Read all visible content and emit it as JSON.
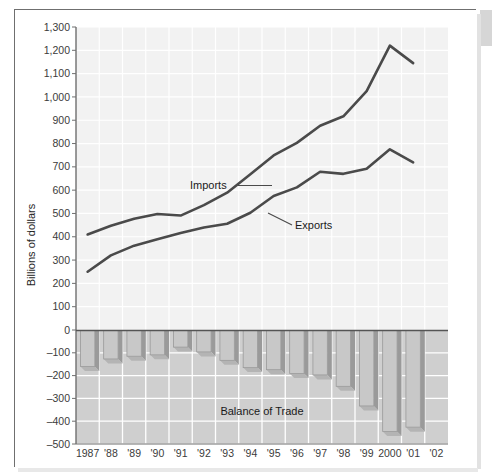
{
  "figure": {
    "y_axis_title": "Billions of dollars",
    "bars_annotation": "Balance of Trade",
    "imports_label": "Imports",
    "exports_label": "Exports",
    "colors": {
      "line": "#4a4a4a",
      "bar_face": "#c8c8c8",
      "bar_edge": "#9a9a9a",
      "upper_panel_bg": "#f2f2f2",
      "lower_panel_bg": "#cfcfcf",
      "grid": "#ffffff",
      "axis": "#6f6f6f",
      "text": "#1f1f1f"
    }
  },
  "chart_data": {
    "type": "line",
    "title": "",
    "xlabel": "",
    "ylabel": "Billions of dollars",
    "grid": true,
    "legend_position": "inline-annotations",
    "x": [
      1987,
      1988,
      1989,
      1990,
      1991,
      1992,
      1993,
      1994,
      1995,
      1996,
      1997,
      1998,
      1999,
      2000,
      2001
    ],
    "tick_labels_x": [
      "1987",
      "'88",
      "'89",
      "'90",
      "'91",
      "'92",
      "'93",
      "'94",
      "'95",
      "'96",
      "'97",
      "'98",
      "'99",
      "2000",
      "'01",
      "'02"
    ],
    "tick_values_y_upper": [
      0,
      100,
      200,
      300,
      400,
      500,
      600,
      700,
      800,
      900,
      1000,
      1100,
      1200,
      1300
    ],
    "tick_labels_y_upper": [
      "0",
      "100",
      "200",
      "300",
      "400",
      "500",
      "600",
      "700",
      "800",
      "900",
      "1,000",
      "1,100",
      "1,200",
      "1,300"
    ],
    "tick_values_y_lower": [
      0,
      -100,
      -200,
      -300,
      -400,
      -500
    ],
    "tick_labels_y_lower": [
      "0",
      "–100",
      "–200",
      "–300",
      "–400",
      "–500"
    ],
    "ylim_upper": [
      0,
      1300
    ],
    "ylim_lower": [
      -500,
      0
    ],
    "series": [
      {
        "name": "Imports",
        "values": [
          410,
          447,
          477,
          498,
          491,
          536,
          589,
          668,
          749,
          803,
          876,
          917,
          1025,
          1220,
          1145
        ]
      },
      {
        "name": "Exports",
        "values": [
          250,
          320,
          362,
          389,
          416,
          440,
          456,
          503,
          575,
          612,
          679,
          670,
          692,
          775,
          719
        ]
      },
      {
        "name": "Balance of Trade",
        "type": "bar",
        "values": [
          -160,
          -127,
          -115,
          -109,
          -75,
          -96,
          -133,
          -165,
          -174,
          -191,
          -197,
          -247,
          -333,
          -445,
          -426
        ]
      }
    ]
  }
}
